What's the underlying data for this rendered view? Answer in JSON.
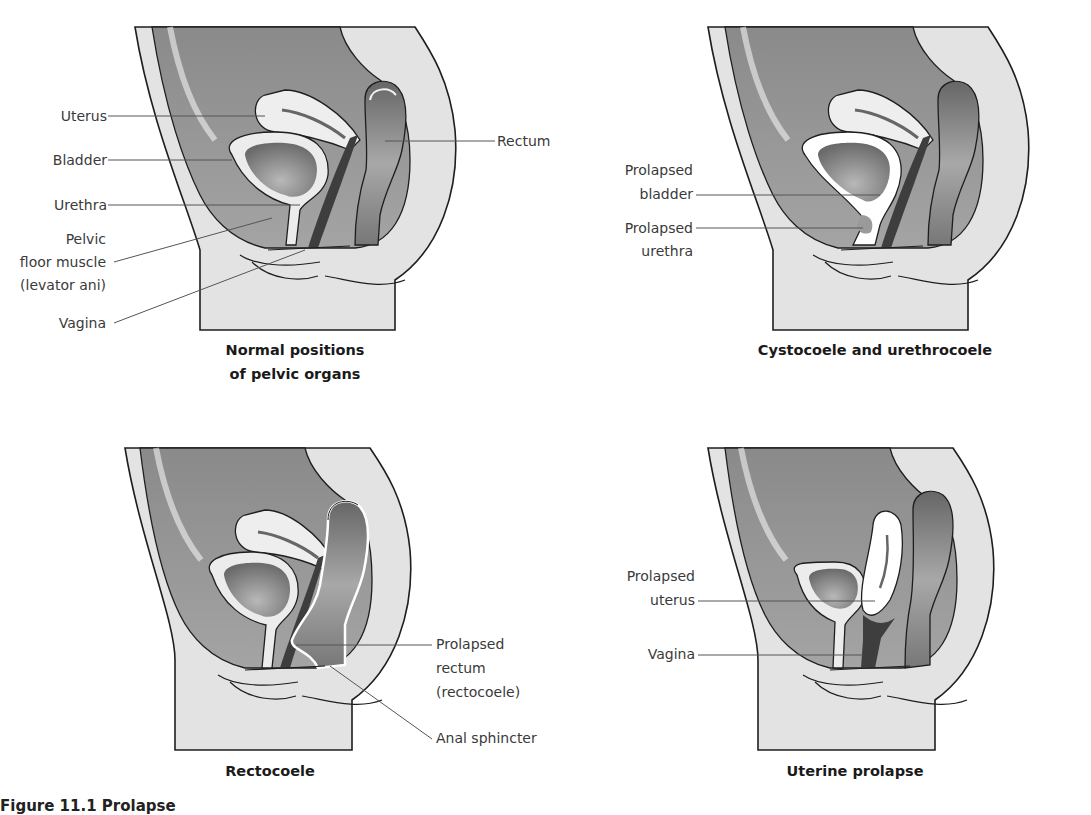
{
  "figure": {
    "caption": "Figure 11.1 Prolapse",
    "colors": {
      "cavity": "#8e8e8e",
      "body": "#e3e3e3",
      "organ_light": "#eeeeee",
      "organ_dark": "#4a4a4a",
      "outline": "#1e1e1e",
      "leader": "#555555",
      "highlight": "#ffffff"
    },
    "panels": [
      {
        "id": "normal",
        "title_lines": [
          "Normal positions",
          "of pelvic organs"
        ],
        "labels": [
          "Uterus",
          "Bladder",
          "Urethra",
          "Pelvic",
          "floor muscle",
          "(levator ani)",
          "Vagina",
          "Rectum"
        ]
      },
      {
        "id": "cystocoele",
        "title_lines": [
          "Cystocoele and urethrocoele"
        ],
        "labels": [
          "Prolapsed",
          "bladder",
          "Prolapsed",
          "urethra"
        ]
      },
      {
        "id": "rectocoele",
        "title_lines": [
          "Rectocoele"
        ],
        "labels": [
          "Prolapsed",
          "rectum",
          "(rectocoele)",
          "Anal sphincter"
        ]
      },
      {
        "id": "uterine",
        "title_lines": [
          "Uterine prolapse"
        ],
        "labels": [
          "Prolapsed",
          "uterus",
          "Vagina"
        ]
      }
    ]
  }
}
